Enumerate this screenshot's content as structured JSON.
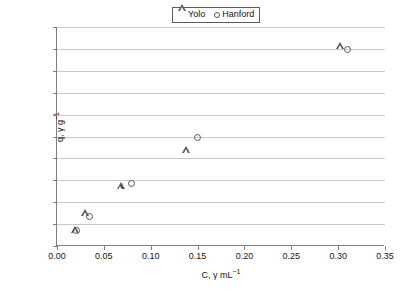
{
  "chart_data": {
    "type": "scatter",
    "title": "",
    "xlabel": "C, γ mL⁻¹",
    "ylabel": "q, γ g⁻¹",
    "xlim": [
      0.0,
      0.35
    ],
    "ylim": [
      0.0,
      200.0
    ],
    "xticks": [
      "0.00",
      "0.05",
      "0.10",
      "0.15",
      "0.20",
      "0.25",
      "0.30",
      "0.35"
    ],
    "xtick_values": [
      0.0,
      0.05,
      0.1,
      0.15,
      0.2,
      0.25,
      0.3,
      0.35
    ],
    "yticks": [
      "0.0",
      "20.0",
      "40.0",
      "60.0",
      "80.0",
      "100.0",
      "120.0",
      "140.0",
      "160.0",
      "180.0",
      "200.0"
    ],
    "ytick_values": [
      0,
      20,
      40,
      60,
      80,
      100,
      120,
      140,
      160,
      180,
      200
    ],
    "grid": "horizontal",
    "legend_position": "top-center",
    "series": [
      {
        "name": "Yolo",
        "marker": "triangle",
        "color": "#555555",
        "points": [
          {
            "x": 0.019,
            "y": 15
          },
          {
            "x": 0.03,
            "y": 31
          },
          {
            "x": 0.068,
            "y": 55
          },
          {
            "x": 0.138,
            "y": 88
          },
          {
            "x": 0.302,
            "y": 183
          }
        ]
      },
      {
        "name": "Hanford",
        "marker": "circle",
        "color": "#555555",
        "points": [
          {
            "x": 0.021,
            "y": 14
          },
          {
            "x": 0.035,
            "y": 27
          },
          {
            "x": 0.079,
            "y": 57
          },
          {
            "x": 0.15,
            "y": 99
          },
          {
            "x": 0.31,
            "y": 179
          }
        ]
      }
    ]
  },
  "legend": {
    "entries": [
      {
        "label": "Yolo",
        "marker": "triangle"
      },
      {
        "label": "Hanford",
        "marker": "circle"
      }
    ]
  },
  "axis": {
    "x_title_main": "C, γ mL",
    "x_title_sup": "−1",
    "y_title_main": "q, γ g",
    "y_title_sup": "−1"
  }
}
